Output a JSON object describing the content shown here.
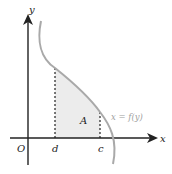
{
  "diagram": {
    "axes": {
      "x_label": "x",
      "y_label": "y",
      "origin_label": "O"
    },
    "points": {
      "d_label": "d",
      "c_label": "c"
    },
    "region_label": "A",
    "curve_label": "x = f(y)",
    "colors": {
      "axis": "#222222",
      "curve": "#a9a9a9",
      "region_fill": "#ececec",
      "curve_label": "#a0a0a0",
      "text": "#222222"
    }
  }
}
